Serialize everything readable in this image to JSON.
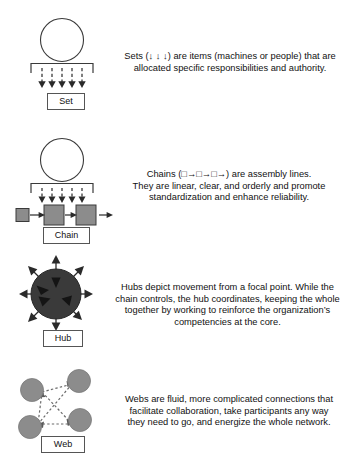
{
  "diagram": {
    "colors": {
      "stroke": "#333333",
      "square_fill": "#8c8c8c",
      "hub_fill": "#3a3a3a",
      "web_fill": "#8c8c8c",
      "label_border": "#555555",
      "text": "#111111",
      "background": "#ffffff"
    },
    "items": [
      {
        "key": "set",
        "label": "Set",
        "icon": "set-icon",
        "shape": "circle-over-bracket-with-five-down-arrows",
        "arrow_count": 5,
        "description": "Sets (↓ ↓ ↓) are items (machines or people) that are allocated specific responsibilities and authority.",
        "description_lines": [
          "Sets (↓ ↓ ↓) are items (machines or people) that are",
          "allocated specific responsibilities and authority."
        ]
      },
      {
        "key": "chain",
        "label": "Chain",
        "icon": "chain-icon",
        "shape": "circle-over-bracket-with-linked-squares",
        "arrow_count": 5,
        "node_count": 3,
        "description": "Chains (□→□→□→) are assembly lines. They are linear, clear, and orderly and promote standardization and enhance reliability.",
        "description_lines": [
          "Chains (□→□→□→) are assembly lines.",
          "They are linear, clear, and orderly and promote",
          "standardization and enhance reliability."
        ]
      },
      {
        "key": "hub",
        "label": "Hub",
        "icon": "hub-icon",
        "shape": "filled-circle-with-eight-radiating-arrows",
        "arrow_count": 8,
        "description": "Hubs depict movement from a focal point. While the chain controls, the hub coordinates, keeping the whole together by working to reinforce the organization’s competencies at the core.",
        "description_lines": [
          "Hubs depict movement from a focal point. While the",
          "chain controls, the hub coordinates, keeping the whole",
          "together by working to reinforce the organization’s",
          "competencies at the core."
        ]
      },
      {
        "key": "web",
        "label": "Web",
        "icon": "web-icon",
        "shape": "four-gray-circles-linked-by-dashed-arrows",
        "node_count": 4,
        "description": "Webs are fluid, more complicated connections that facilitate collaboration, take participants any way they need to go, and energize the whole network.",
        "description_lines": [
          "Webs are fluid, more complicated connections that",
          "facilitate collaboration, take participants any way",
          "they need to go, and energize the whole network."
        ]
      }
    ]
  }
}
